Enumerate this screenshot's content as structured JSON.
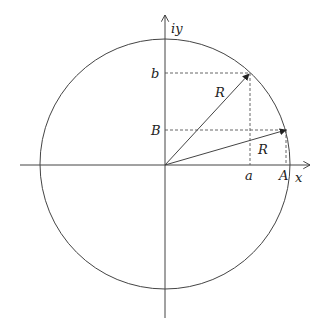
{
  "diagram": {
    "axes": {
      "x_label": "x",
      "y_label": "iy"
    },
    "circle": {
      "cx": 165,
      "cy": 164,
      "r": 125
    },
    "vectors": [
      {
        "name": "R",
        "label": "R",
        "to": [
          250,
          73
        ],
        "proj_x_label": "a",
        "proj_y_label": "b"
      },
      {
        "name": "R",
        "label": "R",
        "to": [
          287,
          130
        ],
        "proj_x_label": "A",
        "proj_y_label": "B"
      }
    ],
    "labels": {
      "b": "b",
      "B": "B",
      "a": "a",
      "A": "A",
      "R_upper": "R",
      "R_lower": "R",
      "x": "x",
      "iy": "iy"
    },
    "colors": {
      "stroke": "#333333",
      "background": "#ffffff"
    }
  }
}
